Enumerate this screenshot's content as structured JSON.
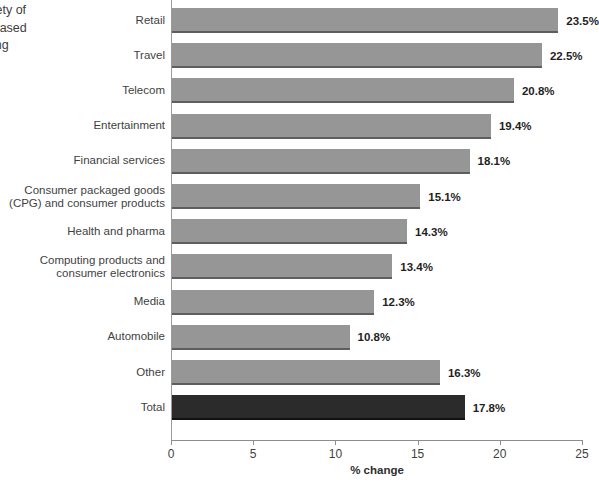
{
  "caption": {
    "body": "s in a variety of\nhave increased\nl advertising\nres.",
    "note": "y 2022."
  },
  "chart_data": {
    "type": "bar",
    "orientation": "horizontal",
    "title": "",
    "xlabel": "% change",
    "ylabel": "",
    "xlim": [
      0,
      25
    ],
    "xticks": [
      0,
      5,
      10,
      15,
      20,
      25
    ],
    "xtick_labels": [
      "0",
      "5",
      "10",
      "15",
      "20",
      "25"
    ],
    "grid": false,
    "legend": null,
    "categories": [
      "Retail",
      "Travel",
      "Telecom",
      "Entertainment",
      "Financial services",
      "Consumer packaged goods\n(CPG) and consumer products",
      "Health and pharma",
      "Computing products and\nconsumer electronics",
      "Media",
      "Automobile",
      "Other",
      "Total"
    ],
    "values": [
      23.5,
      22.5,
      20.8,
      19.4,
      18.1,
      15.1,
      14.3,
      13.4,
      12.3,
      10.8,
      16.3,
      17.8
    ],
    "value_labels": [
      "23.5%",
      "22.5%",
      "20.8%",
      "19.4%",
      "18.1%",
      "15.1%",
      "14.3%",
      "13.4%",
      "12.3%",
      "10.8%",
      "16.3%",
      "17.8%"
    ],
    "bar_colors": [
      "#969696",
      "#969696",
      "#969696",
      "#969696",
      "#969696",
      "#969696",
      "#969696",
      "#969696",
      "#969696",
      "#969696",
      "#969696",
      "#2b2b2b"
    ],
    "highlight_category": "Total",
    "colors": {
      "bar": "#969696",
      "bar_highlight": "#2b2b2b",
      "axis": "#8d8d8d",
      "text": "#3f3f3f"
    }
  }
}
